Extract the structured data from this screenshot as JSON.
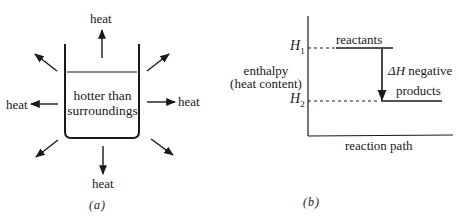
{
  "panel_a": {
    "caption": "(a)",
    "beaker_text_line1": "hotter than",
    "beaker_text_line2": "surroundings",
    "heat_top": "heat",
    "heat_left": "heat",
    "heat_right": "heat",
    "heat_bottom": "heat"
  },
  "panel_b": {
    "caption": "(b)",
    "ylabel_line1": "enthalpy",
    "ylabel_line2": "(heat content)",
    "xlabel": "reaction path",
    "h1_label": "H",
    "h1_sub": "1",
    "h2_label": "H",
    "h2_sub": "2",
    "reactants_label": "reactants",
    "products_label": "products",
    "delta_symbol": "ΔH",
    "delta_text": " negative"
  },
  "colors": {
    "ink": "#1a1a1a",
    "background": "#ffffff"
  }
}
